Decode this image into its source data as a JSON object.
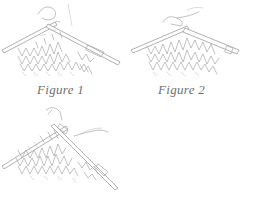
{
  "figures": [
    {
      "id": "figure-1",
      "caption": "Figure 1",
      "depicts": "knitting stitches on two crossed needles, yarn wrapped over the right needle"
    },
    {
      "id": "figure-2",
      "caption": "Figure 2",
      "depicts": "knitting stitches on two crossed needles, new loop being pulled through"
    },
    {
      "id": "figure-3",
      "caption": "",
      "depicts": "knitting stitches on two crossed needles, loop slipped off needle tip with yarn trailing right"
    }
  ],
  "colors": {
    "background": "#ffffff",
    "line_art": "#a8a8a8",
    "caption_text": "#6f6f6f"
  }
}
